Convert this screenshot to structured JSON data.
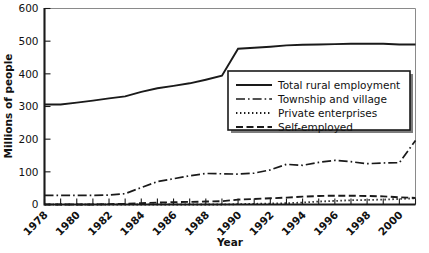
{
  "chart_data": {
    "type": "line",
    "title": "",
    "xlabel": "Year",
    "ylabel": "Millions of people",
    "ylim": [
      0,
      600
    ],
    "xlim": [
      1978,
      2001
    ],
    "yticks": [
      0,
      100,
      200,
      300,
      400,
      500,
      600
    ],
    "ytick_labels": [
      "0",
      "100",
      "200",
      "300",
      "400",
      "500",
      "600"
    ],
    "xticks": [
      1978,
      1979,
      1980,
      1981,
      1982,
      1983,
      1984,
      1985,
      1986,
      1987,
      1988,
      1989,
      1990,
      1991,
      1992,
      1993,
      1994,
      1995,
      1996,
      1997,
      1998,
      1999,
      2000,
      2001
    ],
    "xtick_labels": [
      "1978",
      "1980",
      "1982",
      "1984",
      "1986",
      "1988",
      "1990",
      "1992",
      "1994",
      "1996",
      "1998",
      "2000"
    ],
    "xtick_label_years": [
      1978,
      1980,
      1982,
      1984,
      1986,
      1988,
      1990,
      1992,
      1994,
      1996,
      1998,
      2000
    ],
    "grid": false,
    "legend_position": "inside-right-upper",
    "x": [
      1978,
      1979,
      1980,
      1981,
      1982,
      1983,
      1984,
      1985,
      1986,
      1987,
      1988,
      1989,
      1990,
      1991,
      1992,
      1993,
      1994,
      1995,
      1996,
      1997,
      1998,
      1999,
      2000,
      2001
    ],
    "series": [
      {
        "name": "Total rural employment",
        "style": "solid",
        "values": [
          306,
          306,
          312,
          318,
          325,
          331,
          345,
          356,
          363,
          371,
          382,
          394,
          477,
          480,
          483,
          487,
          489,
          490,
          491,
          492,
          492,
          492,
          490,
          490
        ]
      },
      {
        "name": "Township and village",
        "style": "dashdot",
        "values": [
          28,
          28,
          28,
          28,
          29,
          33,
          52,
          70,
          79,
          88,
          95,
          94,
          93,
          96,
          106,
          123,
          120,
          129,
          135,
          131,
          125,
          127,
          128,
          196
        ]
      },
      {
        "name": "Private enterprises",
        "style": "dotted",
        "values": [
          0,
          0,
          0,
          0,
          0,
          0,
          0,
          0,
          0,
          0,
          0,
          0,
          1,
          2,
          3,
          4,
          6,
          9,
          11,
          13,
          14,
          15,
          17,
          19
        ]
      },
      {
        "name": "Self-employed",
        "style": "dashed",
        "values": [
          0,
          0,
          0,
          0,
          1,
          2,
          4,
          6,
          7,
          8,
          9,
          10,
          15,
          17,
          19,
          21,
          24,
          26,
          27,
          27,
          26,
          25,
          22,
          20
        ]
      }
    ],
    "legend": [
      {
        "label": "Total rural employment",
        "style": "solid"
      },
      {
        "label": "Township and village",
        "style": "dashdot"
      },
      {
        "label": "Private enterprises",
        "style": "dotted"
      },
      {
        "label": "Self-employed",
        "style": "dashed"
      }
    ],
    "colors": {
      "line": "#1a1a1a",
      "frame": "#8a8a8a",
      "background": "#ffffff"
    }
  }
}
